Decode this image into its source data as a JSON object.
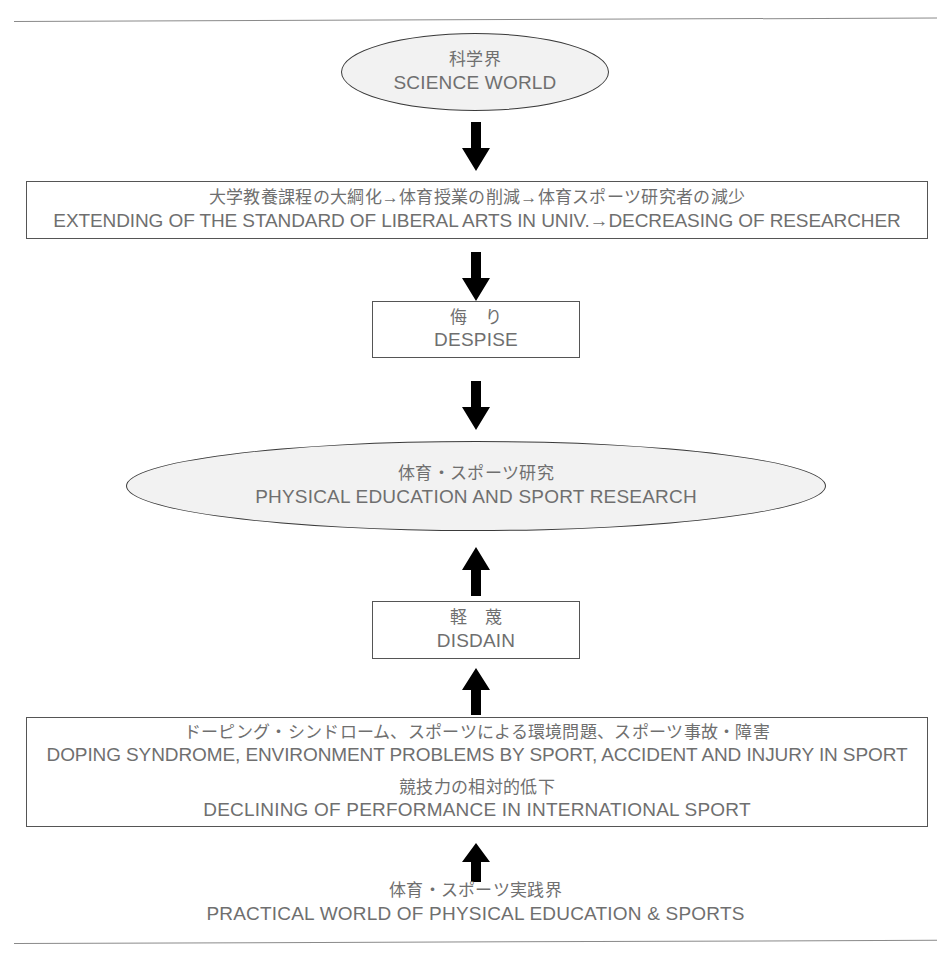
{
  "diagram": {
    "title_jp": "科学界",
    "nodes": {
      "science_world": {
        "jp": "科学界",
        "en": "SCIENCE WORLD",
        "shape": "ellipse"
      },
      "liberal_arts": {
        "jp": "大学教養課程の大綱化→体育授業の削減→体育スポーツ研究者の減少",
        "en": "EXTENDING OF THE STANDARD OF LIBERAL ARTS IN UNIV.→DECREASING OF RESEARCHER",
        "shape": "rectangle"
      },
      "despise": {
        "jp": "侮　り",
        "en": "DESPISE",
        "shape": "rectangle"
      },
      "pe_research": {
        "jp": "体育・スポーツ研究",
        "en": "PHYSICAL EDUCATION AND SPORT RESEARCH",
        "shape": "ellipse"
      },
      "disdain": {
        "jp": "軽　蔑",
        "en": "DISDAIN",
        "shape": "rectangle"
      },
      "problems": {
        "jp_line1": "ドーピング・シンドローム、スポーツによる環境問題、スポーツ事故・障害",
        "en_line1": "DOPING SYNDROME, ENVIRONMENT PROBLEMS BY SPORT, ACCIDENT AND INJURY IN SPORT",
        "jp_line2": "競技力の相対的低下",
        "en_line2": "DECLINING OF PERFORMANCE IN INTERNATIONAL SPORT",
        "shape": "rectangle"
      },
      "practical_world": {
        "jp": "体育・スポーツ実践界",
        "en": "PRACTICAL WORLD OF PHYSICAL EDUCATION & SPORTS",
        "shape": "caption"
      }
    },
    "arrows": [
      {
        "name": "arrow-science-to-liberal-arts",
        "direction": "down"
      },
      {
        "name": "arrow-liberal-arts-to-despise",
        "direction": "down"
      },
      {
        "name": "arrow-despise-to-pe-research",
        "direction": "down"
      },
      {
        "name": "arrow-disdain-to-pe-research",
        "direction": "up"
      },
      {
        "name": "arrow-problems-to-disdain",
        "direction": "up"
      },
      {
        "name": "arrow-practical-world-to-problems",
        "direction": "up"
      }
    ],
    "colors": {
      "text": "#6f6f6f",
      "ellipse_fill": "#f2f2f2",
      "ellipse_stroke": "#3a3a3a",
      "rect_stroke": "#555555",
      "arrow_fill": "#000000",
      "rule": "#8a8a8a"
    }
  }
}
